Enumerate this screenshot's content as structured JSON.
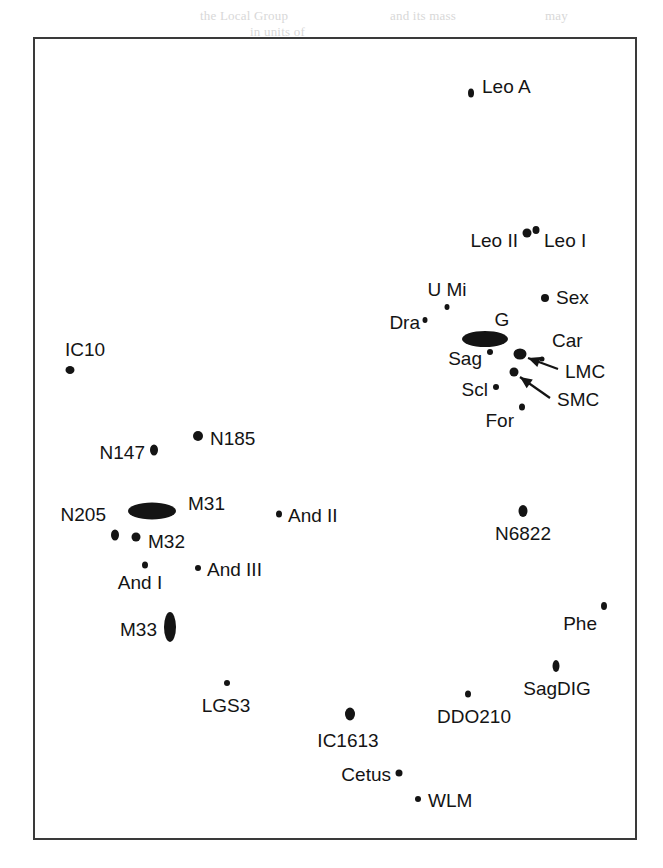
{
  "figure": {
    "frame": {
      "x": 33,
      "y": 37,
      "width": 604,
      "height": 803,
      "border_color": "#3a3a3a"
    },
    "background_color": "#ffffff",
    "marker_color": "#141414"
  },
  "bleed_text": [
    {
      "text": "the Local Group",
      "x": 200,
      "y": 8
    },
    {
      "text": "and its mass",
      "x": 390,
      "y": 8
    },
    {
      "text": "may",
      "x": 545,
      "y": 8
    },
    {
      "text": "in units of",
      "x": 250,
      "y": 24
    }
  ],
  "chart_data": {
    "type": "scatter",
    "xlabel": "",
    "ylabel": "",
    "grid": false,
    "legend": "none",
    "axis_ticks": "none",
    "points": [
      {
        "name": "Leo A",
        "x": 469,
        "y": 91,
        "shape": "ellipse",
        "w": 6,
        "h": 9,
        "label": "Leo A",
        "label_x": 480,
        "label_y": 84,
        "anchor": "start"
      },
      {
        "name": "Leo II",
        "x": 525,
        "y": 231,
        "shape": "ellipse",
        "w": 9,
        "h": 9,
        "label": "Leo II",
        "label_x": 516,
        "label_y": 238,
        "anchor": "end"
      },
      {
        "name": "Leo I",
        "x": 534,
        "y": 228,
        "shape": "ellipse",
        "w": 7,
        "h": 8,
        "label": "Leo I",
        "label_x": 542,
        "label_y": 238,
        "anchor": "start"
      },
      {
        "name": "U Mi",
        "x": 445,
        "y": 305,
        "shape": "ellipse",
        "w": 5,
        "h": 6,
        "label": "U Mi",
        "label_x": 445,
        "label_y": 287,
        "anchor": "mid"
      },
      {
        "name": "Dra",
        "x": 423,
        "y": 318,
        "shape": "ellipse",
        "w": 5,
        "h": 6,
        "label": "Dra",
        "label_x": 418,
        "label_y": 320,
        "anchor": "end"
      },
      {
        "name": "Sex",
        "x": 543,
        "y": 296,
        "shape": "ellipse",
        "w": 8,
        "h": 8,
        "label": "Sex",
        "label_x": 554,
        "label_y": 295,
        "anchor": "start"
      },
      {
        "name": "G",
        "x": 483,
        "y": 337,
        "shape": "ellipse",
        "w": 46,
        "h": 16,
        "label": "G",
        "label_x": 500,
        "label_y": 317,
        "anchor": "mid"
      },
      {
        "name": "Sag",
        "x": 488,
        "y": 350,
        "shape": "ellipse",
        "w": 6,
        "h": 6,
        "label": "Sag",
        "label_x": 480,
        "label_y": 356,
        "anchor": "end"
      },
      {
        "name": "Car",
        "x": 540,
        "y": 357,
        "shape": "ellipse",
        "w": 5,
        "h": 5,
        "label": "Car",
        "label_x": 550,
        "label_y": 338,
        "anchor": "start"
      },
      {
        "name": "LMC",
        "x": 518,
        "y": 352,
        "shape": "ellipse",
        "w": 13,
        "h": 11,
        "label": "LMC",
        "label_x": 563,
        "label_y": 369,
        "anchor": "start"
      },
      {
        "name": "SMC",
        "x": 512,
        "y": 370,
        "shape": "ellipse",
        "w": 9,
        "h": 9,
        "label": "SMC",
        "label_x": 555,
        "label_y": 397,
        "anchor": "start"
      },
      {
        "name": "Scl",
        "x": 494,
        "y": 385,
        "shape": "ellipse",
        "w": 6,
        "h": 6,
        "label": "Scl",
        "label_x": 486,
        "label_y": 387,
        "anchor": "end"
      },
      {
        "name": "For",
        "x": 520,
        "y": 405,
        "shape": "ellipse",
        "w": 6,
        "h": 7,
        "label": "For",
        "label_x": 512,
        "label_y": 418,
        "anchor": "end"
      },
      {
        "name": "IC10",
        "x": 68,
        "y": 368,
        "shape": "ellipse",
        "w": 9,
        "h": 8,
        "label": "IC10",
        "label_x": 63,
        "label_y": 347,
        "anchor": "start"
      },
      {
        "name": "N185",
        "x": 196,
        "y": 434,
        "shape": "ellipse",
        "w": 10,
        "h": 10,
        "label": "N185",
        "label_x": 208,
        "label_y": 436,
        "anchor": "start"
      },
      {
        "name": "N147",
        "x": 152,
        "y": 448,
        "shape": "ellipse",
        "w": 8,
        "h": 11,
        "label": "N147",
        "label_x": 143,
        "label_y": 450,
        "anchor": "end"
      },
      {
        "name": "M31",
        "x": 150,
        "y": 509,
        "shape": "ellipse",
        "w": 48,
        "h": 17,
        "label": "M31",
        "label_x": 186,
        "label_y": 501,
        "anchor": "start"
      },
      {
        "name": "N205",
        "x": 113,
        "y": 533,
        "shape": "ellipse",
        "w": 8,
        "h": 11,
        "label": "N205",
        "label_x": 104,
        "label_y": 512,
        "anchor": "end"
      },
      {
        "name": "M32",
        "x": 134,
        "y": 535,
        "shape": "ellipse",
        "w": 9,
        "h": 9,
        "label": "M32",
        "label_x": 146,
        "label_y": 539,
        "anchor": "start"
      },
      {
        "name": "And II",
        "x": 277,
        "y": 512,
        "shape": "ellipse",
        "w": 6,
        "h": 7,
        "label": "And II",
        "label_x": 286,
        "label_y": 513,
        "anchor": "start"
      },
      {
        "name": "And I",
        "x": 143,
        "y": 563,
        "shape": "ellipse",
        "w": 6,
        "h": 7,
        "label": "And I",
        "label_x": 138,
        "label_y": 580,
        "anchor": "mid"
      },
      {
        "name": "And III",
        "x": 196,
        "y": 566,
        "shape": "ellipse",
        "w": 6,
        "h": 6,
        "label": "And III",
        "label_x": 205,
        "label_y": 567,
        "anchor": "start"
      },
      {
        "name": "N6822",
        "x": 521,
        "y": 509,
        "shape": "ellipse",
        "w": 9,
        "h": 12,
        "label": "N6822",
        "label_x": 521,
        "label_y": 531,
        "anchor": "mid"
      },
      {
        "name": "M33",
        "x": 168,
        "y": 625,
        "shape": "ellipse",
        "w": 12,
        "h": 30,
        "label": "M33",
        "label_x": 155,
        "label_y": 627,
        "anchor": "end"
      },
      {
        "name": "Phe",
        "x": 602,
        "y": 604,
        "shape": "ellipse",
        "w": 6,
        "h": 8,
        "label": "Phe",
        "label_x": 595,
        "label_y": 621,
        "anchor": "end"
      },
      {
        "name": "SagDIG",
        "x": 554,
        "y": 664,
        "shape": "ellipse",
        "w": 7,
        "h": 12,
        "label": "SagDIG",
        "label_x": 555,
        "label_y": 686,
        "anchor": "mid"
      },
      {
        "name": "LGS3",
        "x": 225,
        "y": 681,
        "shape": "ellipse",
        "w": 6,
        "h": 6,
        "label": "LGS3",
        "label_x": 224,
        "label_y": 703,
        "anchor": "mid"
      },
      {
        "name": "DDO210",
        "x": 466,
        "y": 692,
        "shape": "ellipse",
        "w": 6,
        "h": 7,
        "label": "DDO210",
        "label_x": 472,
        "label_y": 714,
        "anchor": "mid"
      },
      {
        "name": "IC1613",
        "x": 348,
        "y": 712,
        "shape": "ellipse",
        "w": 10,
        "h": 13,
        "label": "IC1613",
        "label_x": 346,
        "label_y": 738,
        "anchor": "mid"
      },
      {
        "name": "Cetus",
        "x": 397,
        "y": 771,
        "shape": "ellipse",
        "w": 7,
        "h": 7,
        "label": "Cetus",
        "label_x": 389,
        "label_y": 772,
        "anchor": "end"
      },
      {
        "name": "WLM",
        "x": 416,
        "y": 797,
        "shape": "ellipse",
        "w": 6,
        "h": 6,
        "label": "WLM",
        "label_x": 426,
        "label_y": 798,
        "anchor": "start"
      }
    ],
    "annotations": [
      {
        "name": "lmc-arrow",
        "from_x": 556,
        "from_y": 367,
        "to_x": 526,
        "to_y": 356,
        "target": "LMC"
      },
      {
        "name": "smc-arrow",
        "from_x": 548,
        "from_y": 396,
        "to_x": 518,
        "to_y": 375,
        "target": "SMC"
      }
    ]
  }
}
